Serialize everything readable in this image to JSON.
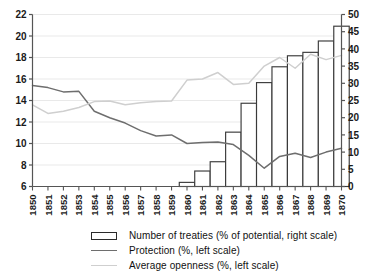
{
  "chart_data": {
    "type": "bar",
    "title": "",
    "subtitle": "",
    "xlabel": "",
    "ylabel": "",
    "grid": true,
    "legend_position": "bottom",
    "categories": [
      "1850",
      "1851",
      "1852",
      "1853",
      "1854",
      "1855",
      "1856",
      "1857",
      "1858",
      "1859",
      "1860",
      "1861",
      "1862",
      "1863",
      "1864",
      "1865",
      "1866",
      "1867",
      "1868",
      "1869",
      "1870"
    ],
    "left_axis": {
      "label": "",
      "ylim": [
        6,
        22
      ],
      "ticks": [
        6,
        8,
        10,
        12,
        14,
        16,
        18,
        20,
        22
      ],
      "tick_labels": [
        "6",
        "8",
        "10",
        "12",
        "14",
        "16",
        "18",
        "20",
        "22"
      ]
    },
    "right_axis": {
      "label": "",
      "ylim": [
        0,
        50
      ],
      "ticks": [
        0,
        5,
        10,
        15,
        20,
        25,
        30,
        35,
        40,
        45,
        50
      ],
      "tick_labels": [
        "0",
        "5",
        "10",
        "15",
        "20",
        "25",
        "30",
        "35",
        "40",
        "45",
        "50"
      ]
    },
    "series": [
      {
        "name": "Number of treaties (% of potential, right scale)",
        "type": "bar",
        "axis": "right",
        "color": "#ffffff",
        "edge_color": "#3a3a3a",
        "values": [
          0,
          0,
          0,
          0,
          0,
          0,
          0,
          0,
          0,
          0,
          1.2,
          4.5,
          7.2,
          15.8,
          24.2,
          30.2,
          34.8,
          38.0,
          39.0,
          42.3,
          46.6
        ]
      },
      {
        "name": "Protection (%, left scale)",
        "type": "line",
        "axis": "left",
        "color": "#6e6e6e",
        "values": [
          15.4,
          15.2,
          14.8,
          14.85,
          13.0,
          12.4,
          11.9,
          11.2,
          10.7,
          10.8,
          10.0,
          10.1,
          10.15,
          9.9,
          8.9,
          7.7,
          8.8,
          9.1,
          8.7,
          9.2,
          9.55
        ]
      },
      {
        "name": "Average openness (%, left scale)",
        "type": "line",
        "axis": "left",
        "color": "#cfcfcf",
        "values": [
          13.6,
          12.8,
          13.0,
          13.35,
          13.9,
          13.95,
          13.6,
          13.8,
          13.9,
          13.95,
          15.9,
          16.0,
          16.6,
          15.5,
          15.6,
          17.2,
          18.0,
          17.0,
          18.3,
          17.8,
          18.2
        ]
      }
    ]
  },
  "legend": {
    "items": [
      {
        "marker": "bar-swatch",
        "label": "Number of treaties (% of potential, right scale)"
      },
      {
        "marker": "line-swatch-dark",
        "label": "Protection (%, left scale)"
      },
      {
        "marker": "line-swatch-light",
        "label": "Average openness (%, left scale)"
      }
    ]
  }
}
